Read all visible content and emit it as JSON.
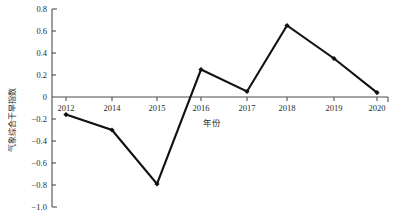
{
  "chart_data": {
    "type": "line",
    "title": "",
    "xlabel": "年份",
    "ylabel": "气象综合干旱指数",
    "categories": [
      "2012",
      "2014",
      "2015",
      "2016",
      "2017",
      "2018",
      "2019",
      "2020"
    ],
    "x": [
      2012,
      2014,
      2015,
      2016,
      2017,
      2018,
      2019,
      2020
    ],
    "values": [
      -0.16,
      -0.3,
      -0.79,
      0.25,
      0.05,
      0.65,
      0.35,
      0.04
    ],
    "series": [
      {
        "name": "气象综合干旱指数",
        "values": [
          -0.16,
          -0.3,
          -0.79,
          0.25,
          0.05,
          0.65,
          0.35,
          0.04
        ]
      }
    ],
    "ylim": [
      -1.0,
      0.8
    ],
    "yticks": [
      0.8,
      0.6,
      0.4,
      0.2,
      0,
      -0.2,
      -0.4,
      -0.6,
      -0.8,
      -1.0
    ],
    "ytick_labels": [
      "0.8",
      "0.6",
      "0.4",
      "0.2",
      "0",
      "−0.2",
      "−0.4",
      "−0.6",
      "−0.8",
      "−1.0"
    ],
    "xtick_labels": [
      "2012",
      "2014",
      "2015",
      "2016",
      "2017",
      "2018",
      "2019",
      "2020"
    ],
    "grid": false,
    "legend": false,
    "legend_position": "none",
    "marker": "filled-diamond",
    "line_color": "#111111",
    "axis_color": "#4d4d4d",
    "background_color": "#ffffff"
  },
  "axes": {
    "y_title": "气象综合干旱指数",
    "x_title": "年份"
  },
  "y_ticks": [
    {
      "label": "0.8",
      "value": 0.8
    },
    {
      "label": "0.6",
      "value": 0.6
    },
    {
      "label": "0.4",
      "value": 0.4
    },
    {
      "label": "0.2",
      "value": 0.2
    },
    {
      "label": "0",
      "value": 0
    },
    {
      "label": "−0.2",
      "value": -0.2
    },
    {
      "label": "−0.4",
      "value": -0.4
    },
    {
      "label": "−0.6",
      "value": -0.6
    },
    {
      "label": "−0.8",
      "value": -0.8
    },
    {
      "label": "−1.0",
      "value": -1.0
    }
  ],
  "x_ticks": [
    {
      "label": "2012"
    },
    {
      "label": "2014"
    },
    {
      "label": "2015"
    },
    {
      "label": "2016"
    },
    {
      "label": "2017"
    },
    {
      "label": "2018"
    },
    {
      "label": "2019"
    },
    {
      "label": "2020"
    }
  ]
}
